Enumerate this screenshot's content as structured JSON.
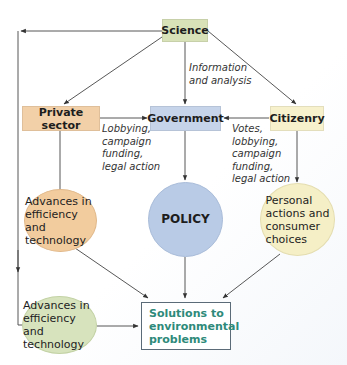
{
  "diagram": {
    "nodes": {
      "science": {
        "label": "Science",
        "color": "#d8e2b8"
      },
      "private_sector": {
        "label": "Private sector",
        "color": "#f2d0a8"
      },
      "government": {
        "label": "Government",
        "color": "#c6d4ea"
      },
      "citizenry": {
        "label": "Citizenry",
        "color": "#f7f1cc"
      },
      "advances_private": {
        "label": "Advances in\nefficiency and\ntechnology",
        "color": "#f2cc9e"
      },
      "policy": {
        "label": "POLICY",
        "color": "#b9cbe6"
      },
      "personal_actions": {
        "label": "Personal\nactions and\nconsumer\nchoices",
        "color": "#f5efc6"
      },
      "advances_science": {
        "label": "Advances in\nefficiency and\ntechnology",
        "color": "#d7e3bd"
      },
      "solutions": {
        "label": "Solutions to\nenvironmental\nproblems",
        "color": "#2e8a7a"
      }
    },
    "edge_labels": {
      "science_to_government": "Information\nand analysis",
      "private_to_government": "Lobbying,\ncampaign\nfunding,\nlegal action",
      "citizenry_to_government": "Votes,\nlobbying,\ncampaign\nfunding,\nlegal action"
    },
    "edges": [
      {
        "from": "science",
        "to": "private_sector"
      },
      {
        "from": "science",
        "to": "government"
      },
      {
        "from": "science",
        "to": "citizenry"
      },
      {
        "from": "science",
        "to": "advances_science"
      },
      {
        "from": "private_sector",
        "to": "government"
      },
      {
        "from": "citizenry",
        "to": "government"
      },
      {
        "from": "private_sector",
        "to": "advances_private"
      },
      {
        "from": "government",
        "to": "policy"
      },
      {
        "from": "citizenry",
        "to": "personal_actions"
      },
      {
        "from": "advances_private",
        "to": "solutions"
      },
      {
        "from": "policy",
        "to": "solutions"
      },
      {
        "from": "personal_actions",
        "to": "solutions"
      },
      {
        "from": "advances_science",
        "to": "solutions"
      }
    ]
  }
}
